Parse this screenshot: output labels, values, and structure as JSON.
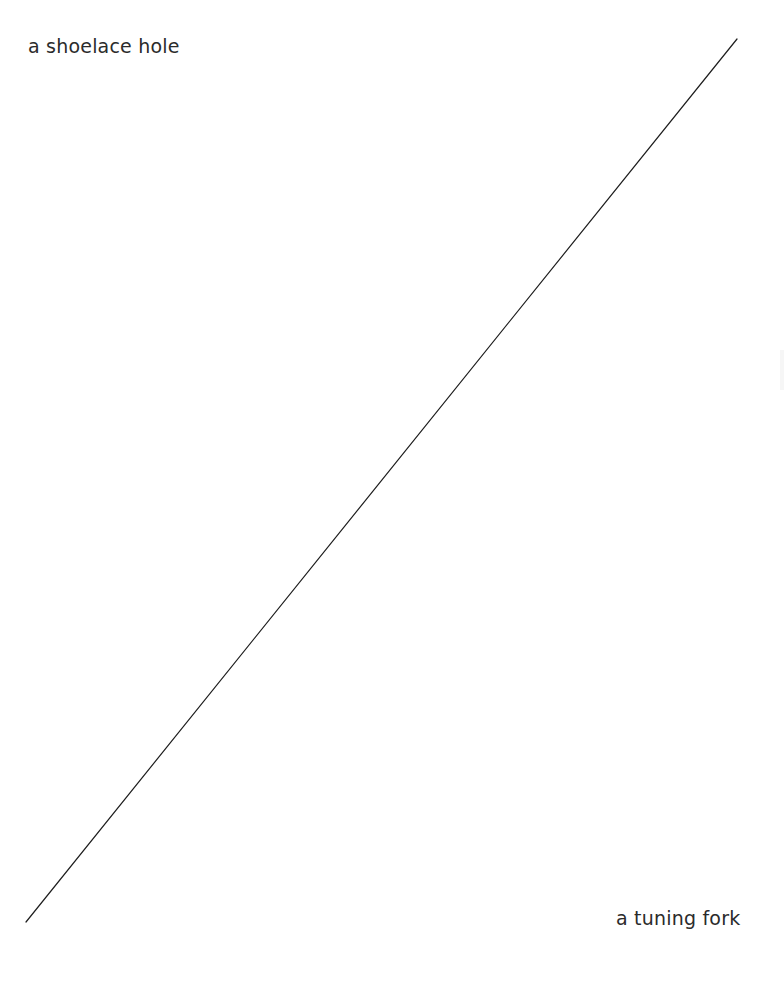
{
  "diagram": {
    "labels": {
      "top_left": "a shoelace hole",
      "bottom_right": "a tuning fork"
    },
    "connector": {
      "x1": 737,
      "y1": 39,
      "x2": 26,
      "y2": 922,
      "color": "#1e1e1e",
      "width": 1.2
    }
  }
}
